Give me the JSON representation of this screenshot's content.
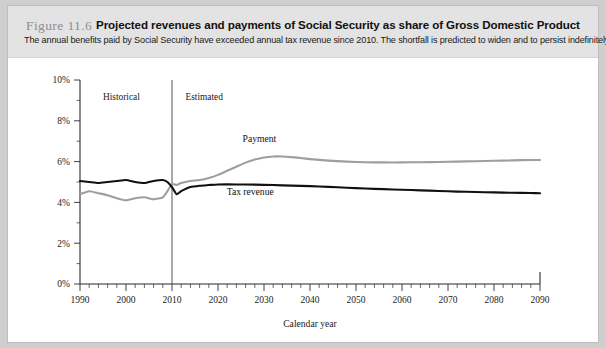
{
  "figure": {
    "number_label": "Figure 11.6",
    "title": "Projected revenues and payments of Social Security as share of Gross Domestic Product",
    "subtitle": "The annual benefits paid by Social Security have exceeded annual tax revenue since 2010. The shortfall is predicted to widen and to persist indefinitely."
  },
  "chart_data": {
    "type": "line",
    "title": "Projected revenues and payments of Social Security as share of Gross Domestic Product",
    "xlabel": "Calendar year",
    "ylabel": "",
    "xlim": [
      1990,
      2090
    ],
    "ylim": [
      0,
      10
    ],
    "grid": false,
    "legend_position": "inline-labels",
    "x_ticks": [
      1990,
      2000,
      2010,
      2020,
      2030,
      2040,
      2050,
      2060,
      2070,
      2080,
      2090
    ],
    "x_tick_labels": [
      "1990",
      "2000",
      "2010",
      "2020",
      "2030",
      "2040",
      "2050",
      "2060",
      "2070",
      "2080",
      "2090"
    ],
    "x_minor_tick_step": 2,
    "y_ticks": [
      0,
      2,
      4,
      6,
      8,
      10
    ],
    "y_tick_labels": [
      "0%",
      "2%",
      "4%",
      "6%",
      "8%",
      "10%"
    ],
    "y_minor_tick_step": 1,
    "annotations": [
      {
        "text": "Historical",
        "x": 1999,
        "y": 9.0
      },
      {
        "text": "Estimated",
        "x": 2017,
        "y": 9.0
      }
    ],
    "divider": {
      "x": 2010,
      "label_left": "Historical",
      "label_right": "Estimated"
    },
    "series": [
      {
        "name": "Payment",
        "color": "#9e9e9e",
        "label_position": {
          "x": 2029,
          "y": 6.95
        },
        "x": [
          1990,
          1992,
          1994,
          1996,
          1998,
          2000,
          2002,
          2004,
          2006,
          2008,
          2009,
          2010,
          2011,
          2012,
          2014,
          2016,
          2018,
          2020,
          2022,
          2024,
          2026,
          2028,
          2030,
          2032,
          2034,
          2036,
          2038,
          2040,
          2044,
          2048,
          2052,
          2056,
          2060,
          2064,
          2068,
          2072,
          2076,
          2080,
          2084,
          2088,
          2090
        ],
        "values": [
          4.4,
          4.55,
          4.45,
          4.35,
          4.2,
          4.1,
          4.2,
          4.25,
          4.15,
          4.25,
          4.55,
          4.9,
          4.85,
          4.95,
          5.05,
          5.1,
          5.2,
          5.35,
          5.55,
          5.75,
          5.95,
          6.1,
          6.2,
          6.25,
          6.25,
          6.22,
          6.18,
          6.12,
          6.05,
          6.0,
          5.97,
          5.96,
          5.96,
          5.97,
          5.98,
          6.0,
          6.02,
          6.04,
          6.06,
          6.08,
          6.08
        ]
      },
      {
        "name": "Tax revenue",
        "color": "#101010",
        "label_position": {
          "x": 2027,
          "y": 4.35
        },
        "x": [
          1990,
          1992,
          1994,
          1996,
          1998,
          2000,
          2002,
          2004,
          2006,
          2008,
          2009,
          2010,
          2011,
          2012,
          2014,
          2016,
          2018,
          2020,
          2024,
          2028,
          2032,
          2036,
          2040,
          2044,
          2048,
          2052,
          2056,
          2060,
          2064,
          2068,
          2072,
          2076,
          2080,
          2084,
          2088,
          2090
        ],
        "values": [
          5.05,
          5.0,
          4.95,
          5.0,
          5.05,
          5.1,
          5.0,
          4.95,
          5.05,
          5.1,
          5.0,
          4.75,
          4.4,
          4.55,
          4.75,
          4.82,
          4.85,
          4.88,
          4.88,
          4.87,
          4.85,
          4.82,
          4.8,
          4.76,
          4.72,
          4.68,
          4.65,
          4.62,
          4.59,
          4.56,
          4.53,
          4.51,
          4.49,
          4.47,
          4.46,
          4.45
        ]
      }
    ]
  }
}
